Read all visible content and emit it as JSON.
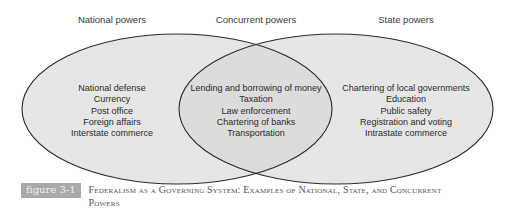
{
  "diagram": {
    "type": "venn",
    "sets": [
      {
        "heading": "National powers",
        "items": [
          "National defense",
          "Currency",
          "Post office",
          "Foreign affairs",
          "Interstate commerce"
        ]
      },
      {
        "heading": "Concurrent powers",
        "items": [
          "Lending and borrowing of money",
          "Taxation",
          "Law enforcement",
          "Chartering of banks",
          "Transportation"
        ]
      },
      {
        "heading": "State powers",
        "items": [
          "Chartering of local governments",
          "Education",
          "Public safety",
          "Registration and voting",
          "Intrastate commerce"
        ]
      }
    ],
    "colors": {
      "fill": "#e4e4e4",
      "stroke": "#2a2a2a",
      "label_bg": "#a9a9a9"
    }
  },
  "caption": {
    "label": "figure 3-1",
    "title": "Federalism as a Governing System: Examples of National, State, and Concurrent Powers"
  }
}
